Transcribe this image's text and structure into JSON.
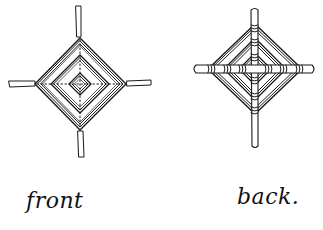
{
  "diagram": {
    "style": "hand-drawn ink line drawing",
    "ink_color": "#1a1a1a",
    "background": "#ffffff",
    "figures": [
      {
        "id": "front",
        "label": "front",
        "center": [
          80,
          84
        ],
        "diamond_half_width": 45,
        "diamond_half_height": 45,
        "rings": [
          45,
          42,
          39,
          29,
          26,
          23,
          11,
          8
        ],
        "sticks": {
          "top": [
            78,
            5,
            78,
            37
          ],
          "bottom": [
            80,
            131,
            81,
            157
          ],
          "left": [
            9,
            84,
            35,
            84
          ],
          "right": [
            127,
            84,
            151,
            83
          ]
        },
        "cross_lines": "dotted"
      },
      {
        "id": "back",
        "label": "back.",
        "center": [
          255,
          69
        ],
        "diamond_half_width": 47,
        "diamond_half_height": 45,
        "rings": [
          47,
          44,
          41,
          31,
          28,
          25,
          16,
          13
        ],
        "sticks": {
          "vertical": [
            255,
            9,
            255,
            147
          ],
          "horizontal": [
            194,
            69,
            314,
            69
          ]
        },
        "wraps": "yarn wrapped around sticks at each ring crossing"
      }
    ]
  },
  "labels": {
    "front": "front",
    "back": "back."
  }
}
